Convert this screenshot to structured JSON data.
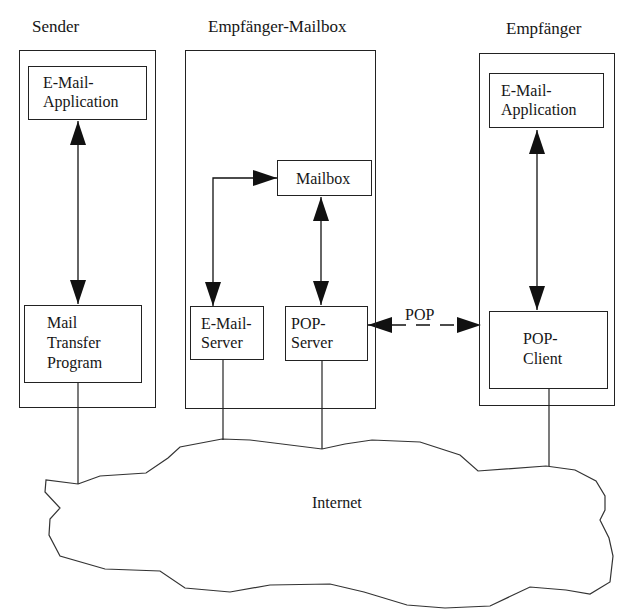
{
  "diagram": {
    "columns": [
      {
        "id": "sender",
        "title": "Sender",
        "components": [
          {
            "id": "sender-email-app",
            "lines": [
              "E-Mail-",
              "Application"
            ]
          },
          {
            "id": "sender-mtp",
            "lines": [
              "Mail",
              "Transfer",
              "Program"
            ]
          }
        ]
      },
      {
        "id": "mailbox",
        "title": "Empfänger-Mailbox",
        "components": [
          {
            "id": "mailbox-store",
            "lines": [
              "Mailbox"
            ]
          },
          {
            "id": "email-server",
            "lines": [
              "E-Mail-",
              "Server"
            ]
          },
          {
            "id": "pop-server",
            "lines": [
              "POP-",
              "Server"
            ]
          }
        ]
      },
      {
        "id": "receiver",
        "title": "Empfänger",
        "components": [
          {
            "id": "receiver-email-app",
            "lines": [
              "E-Mail-",
              "Application"
            ]
          },
          {
            "id": "pop-client",
            "lines": [
              "POP-",
              "Client"
            ]
          }
        ]
      }
    ],
    "connections": [
      {
        "from": "sender-email-app",
        "to": "sender-mtp",
        "type": "bidirectional"
      },
      {
        "from": "email-server",
        "to": "mailbox-store",
        "type": "directed-elbow"
      },
      {
        "from": "mailbox-store",
        "to": "pop-server",
        "type": "bidirectional"
      },
      {
        "from": "receiver-email-app",
        "to": "pop-client",
        "type": "bidirectional"
      },
      {
        "from": "pop-server",
        "to": "pop-client",
        "type": "bidirectional-dashed",
        "label": "POP"
      }
    ],
    "network": {
      "label": "Internet"
    },
    "colors": {
      "line": "#222222",
      "background": "#ffffff"
    }
  }
}
